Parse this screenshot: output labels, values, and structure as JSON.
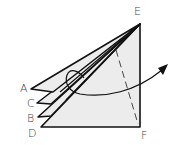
{
  "diagram": {
    "type": "origami-fold-diagram",
    "labels": {
      "A": "A",
      "B": "B",
      "C": "C",
      "D": "D",
      "E": "E",
      "F": "F"
    },
    "colors": {
      "paper_fill": "#ececec",
      "stroke": "#111111",
      "label": "#444444"
    },
    "elements": {
      "layers": [
        "A-E flap",
        "C-E flap",
        "B-E flap",
        "D-E-F base"
      ],
      "fold_line": "dashed valley line from near E toward F",
      "arrow": "curved arrow looping from left flaps swinging to the right"
    }
  }
}
